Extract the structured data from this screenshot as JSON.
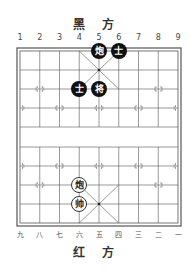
{
  "header": {
    "black_side_label": "黑 方"
  },
  "footer": {
    "red_side_label": "红 方"
  },
  "top_column_numbers": [
    "1",
    "2",
    "3",
    "4",
    "5",
    "6",
    "7",
    "8",
    "9"
  ],
  "bottom_column_numbers": [
    "九",
    "八",
    "七",
    "六",
    "五",
    "四",
    "三",
    "二",
    "一"
  ],
  "board": {
    "columns": 9,
    "rows": 10,
    "line_color": "#555555",
    "pieces": [
      {
        "side": "black",
        "char": "炮",
        "col": 4,
        "row": 0
      },
      {
        "side": "black",
        "char": "士",
        "col": 5,
        "row": 0
      },
      {
        "side": "black",
        "char": "士",
        "col": 3,
        "row": 2
      },
      {
        "side": "black",
        "char": "将",
        "col": 4,
        "row": 2
      },
      {
        "side": "red",
        "char": "炮",
        "col": 3,
        "row": 7
      },
      {
        "side": "red",
        "char": "帅",
        "col": 3,
        "row": 8
      }
    ]
  }
}
